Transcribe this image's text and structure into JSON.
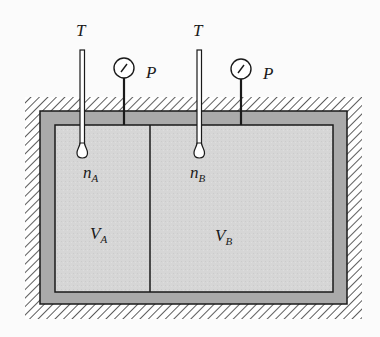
{
  "diagram": {
    "colors": {
      "background": "#fbfbfb",
      "hatch": "#333333",
      "wall": "#aaaaaa",
      "interior": "#d6d6d6",
      "line": "#1a1a1a"
    },
    "compartments": [
      {
        "id": "A",
        "thermometer_label": "T",
        "gauge_label": "P",
        "moles_label": "n",
        "moles_subscript": "A",
        "volume_label": "V",
        "volume_subscript": "A"
      },
      {
        "id": "B",
        "thermometer_label": "T",
        "gauge_label": "P",
        "moles_label": "n",
        "moles_subscript": "B",
        "volume_label": "V",
        "volume_subscript": "B"
      }
    ]
  }
}
